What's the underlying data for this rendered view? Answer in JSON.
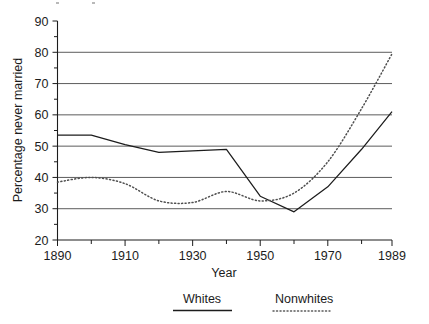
{
  "chart_data": {
    "type": "line",
    "title": "",
    "xlabel": "Year",
    "ylabel": "Percentage never married",
    "xlim": [
      1890,
      1989
    ],
    "ylim": [
      20,
      90
    ],
    "grid": "horizontal",
    "legend_position": "bottom",
    "x_ticks": [
      1890,
      1900,
      1910,
      1920,
      1930,
      1940,
      1950,
      1960,
      1970,
      1980,
      1989
    ],
    "x_tick_labels": [
      "1890",
      "",
      "1910",
      "",
      "1930",
      "",
      "1950",
      "",
      "1970",
      "",
      "1989"
    ],
    "y_ticks": [
      20,
      25,
      30,
      35,
      40,
      45,
      50,
      55,
      60,
      65,
      70,
      75,
      80,
      85,
      90
    ],
    "y_tick_labels": [
      "20",
      "",
      "30",
      "",
      "40",
      "",
      "50",
      "",
      "60",
      "",
      "70",
      "",
      "80",
      "",
      "90"
    ],
    "gridline_values": [
      30,
      40,
      50,
      60,
      70,
      80
    ],
    "x": [
      1890,
      1900,
      1910,
      1920,
      1930,
      1940,
      1950,
      1960,
      1970,
      1980,
      1989
    ],
    "series": [
      {
        "name": "Whites",
        "style": "solid",
        "color": "#1c1c1c",
        "values": [
          53.5,
          53.5,
          50.5,
          48.0,
          48.5,
          49.0,
          34.0,
          29.0,
          37.0,
          49.0,
          61.0
        ]
      },
      {
        "name": "Nonwhites",
        "style": "dotted",
        "color": "#4f4f4f",
        "values": [
          38.5,
          40.0,
          38.0,
          32.5,
          32.0,
          35.5,
          32.5,
          35.0,
          45.0,
          62.0,
          79.5
        ]
      }
    ]
  },
  "axes": {
    "y_title": "Percentage never married",
    "x_title": "Year"
  },
  "legend": {
    "items": [
      {
        "label": "Whites",
        "style": "solid"
      },
      {
        "label": "Nonwhites",
        "style": "dotted"
      }
    ]
  }
}
